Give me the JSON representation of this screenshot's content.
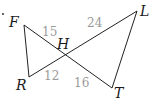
{
  "diagram": {
    "type": "geometry-figure",
    "points": [
      {
        "name": "F",
        "x": 24,
        "y": 25
      },
      {
        "name": "L",
        "x": 137,
        "y": 11
      },
      {
        "name": "H",
        "x": 65,
        "y": 55
      },
      {
        "name": "R",
        "x": 29,
        "y": 77
      },
      {
        "name": "T",
        "x": 112,
        "y": 88
      }
    ],
    "labels": {
      "F": "F",
      "L": "L",
      "H": "H",
      "R": "R",
      "T": "T"
    },
    "segments": [
      {
        "from": "F",
        "to": "H",
        "length": "15"
      },
      {
        "from": "H",
        "to": "L",
        "length": "24"
      },
      {
        "from": "R",
        "to": "H",
        "length": "12"
      },
      {
        "from": "H",
        "to": "T",
        "length": "16"
      },
      {
        "from": "F",
        "to": "R",
        "length": ""
      },
      {
        "from": "L",
        "to": "T",
        "length": ""
      }
    ],
    "lengths": {
      "FH": "15",
      "HL": "24",
      "RH": "12",
      "HT": "16"
    },
    "bullet": "·"
  }
}
